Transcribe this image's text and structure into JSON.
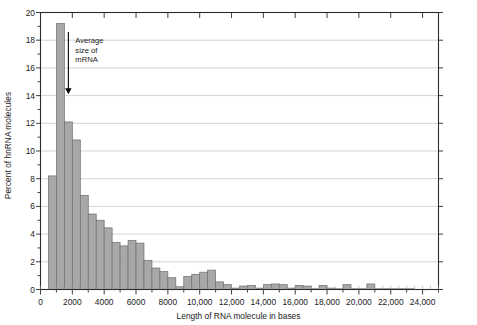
{
  "chart_data": {
    "type": "bar",
    "title": "",
    "subtitle": "",
    "xlabel": "Length of RNA molecule in bases",
    "ylabel": "Percent of hnRNA molecules",
    "xlim": [
      0,
      25000
    ],
    "ylim": [
      0,
      20
    ],
    "grid": "horizontal",
    "legend": "none",
    "bar_width": 500,
    "bar_fill": "#a8a8a8",
    "bar_stroke": "#6e6e6e",
    "axis_color": "#2b2b2b",
    "grid_color": "#c8c8c8",
    "x_major_ticks": [
      0,
      2000,
      4000,
      6000,
      8000,
      10000,
      12000,
      14000,
      16000,
      18000,
      20000,
      22000,
      24000
    ],
    "x_tick_labels": [
      "0",
      "2000",
      "4000",
      "6000",
      "8000",
      "10,000",
      "12,000",
      "14,000",
      "16,000",
      "18,000",
      "20,000",
      "22,000",
      "24,000"
    ],
    "x_minor_interval": 500,
    "y_major_ticks": [
      0,
      2,
      4,
      6,
      8,
      10,
      12,
      14,
      16,
      18,
      20
    ],
    "y_tick_labels": [
      "0",
      "2",
      "4",
      "6",
      "8",
      "10",
      "12",
      "14",
      "16",
      "18",
      "20"
    ],
    "y_minor_interval": 1,
    "bin_starts": [
      500,
      1000,
      1500,
      2000,
      2500,
      3000,
      3500,
      4000,
      4500,
      5000,
      5500,
      6000,
      6500,
      7000,
      7500,
      8000,
      8500,
      9000,
      9500,
      10000,
      10500,
      11000,
      11500,
      12000,
      12500,
      13000,
      13500,
      14000,
      14500,
      15000,
      15500,
      16000,
      16500,
      17000,
      17500,
      18000,
      18500,
      19000,
      19500,
      20000,
      20500,
      21000,
      21500,
      22000,
      22500,
      23000
    ],
    "categories": [
      "500",
      "1000",
      "1500",
      "2000",
      "2500",
      "3000",
      "3500",
      "4000",
      "4500",
      "5000",
      "5500",
      "6000",
      "6500",
      "7000",
      "7500",
      "8000",
      "8500",
      "9000",
      "9500",
      "10,000",
      "10,500",
      "11,000",
      "11,500",
      "12,000",
      "12,500",
      "13,000",
      "13,500",
      "14,000",
      "14,500",
      "15,000",
      "15,500",
      "16,000",
      "16,500",
      "17,000",
      "17,500",
      "18,000",
      "18,500",
      "19,000",
      "19,500",
      "20,000",
      "20,500",
      "21,000",
      "21,500",
      "22,000",
      "22,500",
      "23,000"
    ],
    "values": [
      8.2,
      19.2,
      12.1,
      10.8,
      6.8,
      5.45,
      5.0,
      4.45,
      3.4,
      3.15,
      3.55,
      3.35,
      2.1,
      1.55,
      1.3,
      0.85,
      0.2,
      0.95,
      1.1,
      1.25,
      1.4,
      0.55,
      0.35,
      0.1,
      0.25,
      0.3,
      0.1,
      0.35,
      0.4,
      0.35,
      0.1,
      0.3,
      0.25,
      0.05,
      0.3,
      0.1,
      0.05,
      0.35,
      0.05,
      0.05,
      0.4,
      0.05,
      0.05,
      0.05,
      0.05,
      0.05
    ]
  },
  "annotation": {
    "line1": "Average",
    "line2": "size of",
    "line3": "mRNA",
    "arrow_x_value": 1750,
    "arrow_top_value": 18.6,
    "arrow_bottom_value": 14.1
  }
}
